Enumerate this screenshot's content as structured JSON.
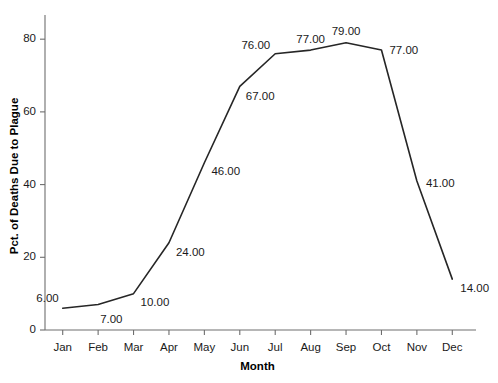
{
  "chart_data": {
    "type": "line",
    "title": "",
    "xlabel": "Month",
    "ylabel": "Pct. of Deaths Due to Plague",
    "categories": [
      "Jan",
      "Feb",
      "Mar",
      "Apr",
      "May",
      "Jun",
      "Jul",
      "Aug",
      "Sep",
      "Oct",
      "Nov",
      "Dec"
    ],
    "values": [
      6,
      7,
      10,
      24,
      46,
      67,
      76,
      77,
      79,
      77,
      41,
      14
    ],
    "point_labels": [
      "6.00",
      "7.00",
      "10.00",
      "24.00",
      "46.00",
      "67.00",
      "76.00",
      "77.00",
      "79.00",
      "77.00",
      "41.00",
      "14.00"
    ],
    "ylim": [
      0,
      85
    ],
    "yticks": [
      0,
      20,
      40,
      60,
      80
    ],
    "ytick_labels": [
      "0",
      "20",
      "40",
      "60",
      "80"
    ],
    "grid": false,
    "legend": false,
    "line_color": "#262626",
    "line_width": 1.6,
    "markers": false,
    "background_color": "#ffffff",
    "axis_color": "#6e6e6e",
    "text_color": "#1a1a1a"
  },
  "label_offsets": [
    {
      "dx": -4,
      "dy": -15,
      "align": "right"
    },
    {
      "dx": 2,
      "dy": 9,
      "align": "left"
    },
    {
      "dx": 7,
      "dy": 3,
      "align": "left"
    },
    {
      "dx": 7,
      "dy": 4,
      "align": "left"
    },
    {
      "dx": 7,
      "dy": 3,
      "align": "left"
    },
    {
      "dx": 6,
      "dy": 5,
      "align": "left"
    },
    {
      "dx": -5,
      "dy": -14,
      "align": "right"
    },
    {
      "dx": 0,
      "dy": -16,
      "align": "center"
    },
    {
      "dx": 0,
      "dy": -17,
      "align": "center"
    },
    {
      "dx": 8,
      "dy": -5,
      "align": "left"
    },
    {
      "dx": 9,
      "dy": -3,
      "align": "left"
    },
    {
      "dx": 8,
      "dy": 4,
      "align": "left"
    }
  ]
}
